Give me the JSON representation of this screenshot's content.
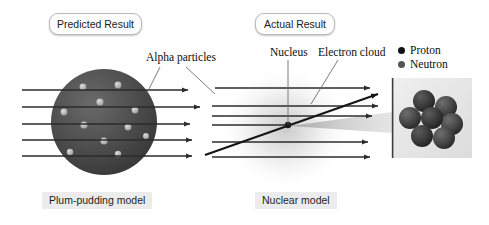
{
  "figure": {
    "background": "#ffffff",
    "width": 489,
    "height": 225
  },
  "callouts": {
    "predicted": "Predicted Result",
    "actual": "Actual Result"
  },
  "captions": {
    "plum_pudding": "Plum-pudding model",
    "nuclear": "Nuclear model"
  },
  "annotations": {
    "alpha_particles": "Alpha particles",
    "nucleus": "Nucleus",
    "electron_cloud": "Electron cloud"
  },
  "legend": {
    "items": [
      {
        "label": "Proton",
        "color": "#111111"
      },
      {
        "label": "Neutron",
        "color": "#555555"
      }
    ]
  },
  "colors": {
    "beam": "#2b2b2b",
    "deflected_beam": "#1a1a1a",
    "leader_line": "#6d6d6d",
    "sphere_dark": "#4a4a4a",
    "sphere_edge": "#3a3a3a",
    "electron_dot": "#b4b4b4",
    "nucleus_dot": "#1a1a1a",
    "scatter_cone": "#b0b0b0",
    "electron_haze": "#c9c9c9",
    "inset_panel": "#e6e6e6",
    "inset_border": "#3d3d3d",
    "nucleon": "#3b3b3b",
    "caption_bg": "#ececec",
    "pill_bg": "#fdfdfd",
    "pill_border": "#b9b9b9"
  },
  "plum_pudding_model": {
    "sphere": {
      "cx": 104,
      "cy": 122,
      "r": 53
    },
    "electron_dots": [
      {
        "cx": 83,
        "cy": 87,
        "r": 3.4
      },
      {
        "cx": 118,
        "cy": 85,
        "r": 3.4
      },
      {
        "cx": 100,
        "cy": 102,
        "r": 3.6
      },
      {
        "cx": 64,
        "cy": 112,
        "r": 3.4
      },
      {
        "cx": 135,
        "cy": 110,
        "r": 3.4
      },
      {
        "cx": 84,
        "cy": 125,
        "r": 3.6
      },
      {
        "cx": 128,
        "cy": 127,
        "r": 3.4
      },
      {
        "cx": 104,
        "cy": 141,
        "r": 3.6
      },
      {
        "cx": 70,
        "cy": 152,
        "r": 3.2
      },
      {
        "cx": 118,
        "cy": 154,
        "r": 3.2
      },
      {
        "cx": 146,
        "cy": 136,
        "r": 3.0
      }
    ],
    "beams": [
      {
        "y": 90,
        "x1": 22,
        "x2": 188
      },
      {
        "y": 107,
        "x1": 22,
        "x2": 200
      },
      {
        "y": 124,
        "x1": 22,
        "x2": 190
      },
      {
        "y": 140,
        "x1": 22,
        "x2": 192
      },
      {
        "y": 156,
        "x1": 22,
        "x2": 192
      }
    ]
  },
  "nuclear_model": {
    "nucleus": {
      "cx": 288,
      "cy": 125,
      "r": 3.2
    },
    "haze": {
      "cx": 285,
      "cy": 128,
      "rx": 66,
      "ry": 62
    },
    "straight_beams": [
      {
        "y": 88,
        "x1": 215,
        "x2": 370
      },
      {
        "y": 106,
        "x1": 212,
        "x2": 378
      },
      {
        "y": 116,
        "x1": 212,
        "x2": 372
      },
      {
        "y": 125,
        "x1": 212,
        "x2": 288
      },
      {
        "y": 142,
        "x1": 212,
        "x2": 368
      },
      {
        "y": 157,
        "x1": 212,
        "x2": 370
      }
    ],
    "deflected_beam": {
      "x1": 205,
      "y1": 155,
      "x2": 378,
      "y2": 94
    },
    "scatter_cone": {
      "apex_x": 290,
      "apex_y": 126,
      "end_x": 392,
      "top_y": 112,
      "bottom_y": 133
    }
  },
  "nucleus_inset": {
    "panel": {
      "x": 392,
      "y": 78,
      "w": 80,
      "h": 80
    },
    "nucleons": [
      {
        "cx": 424,
        "cy": 101,
        "r": 11,
        "type": "proton"
      },
      {
        "cx": 446,
        "cy": 107,
        "r": 11,
        "type": "neutron"
      },
      {
        "cx": 410,
        "cy": 118,
        "r": 11,
        "type": "neutron"
      },
      {
        "cx": 432,
        "cy": 118,
        "r": 11,
        "type": "proton"
      },
      {
        "cx": 452,
        "cy": 124,
        "r": 11,
        "type": "neutron"
      },
      {
        "cx": 422,
        "cy": 136,
        "r": 11,
        "type": "proton"
      },
      {
        "cx": 444,
        "cy": 138,
        "r": 11,
        "type": "neutron"
      }
    ]
  }
}
